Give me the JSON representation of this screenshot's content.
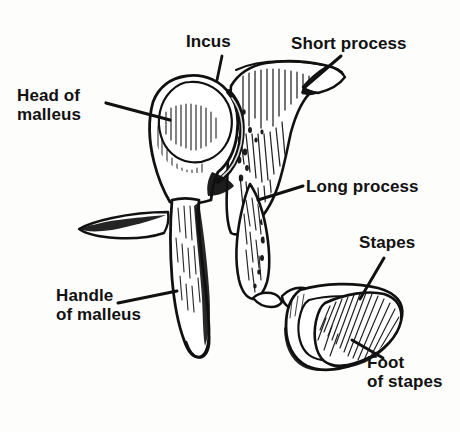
{
  "figure": {
    "kind": "anatomical-line-drawing",
    "ink_color": "#111111",
    "background_color": "#fdfdfb"
  },
  "labels": {
    "head_of_malleus": "Head of\nmalleus",
    "incus": "Incus",
    "short_process": "Short process",
    "long_process": "Long process",
    "stapes": "Stapes",
    "foot_of_stapes": "Foot\nof stapes",
    "handle_of_malleus": "Handle\nof malleus"
  },
  "parts": [
    {
      "name": "malleus-head",
      "label_key": "head_of_malleus"
    },
    {
      "name": "malleus-handle",
      "label_key": "handle_of_malleus"
    },
    {
      "name": "incus-body",
      "label_key": "incus"
    },
    {
      "name": "incus-short-process",
      "label_key": "short_process"
    },
    {
      "name": "incus-long-process",
      "label_key": "long_process"
    },
    {
      "name": "stapes-arch",
      "label_key": "stapes"
    },
    {
      "name": "stapes-footplate",
      "label_key": "foot_of_stapes"
    }
  ]
}
